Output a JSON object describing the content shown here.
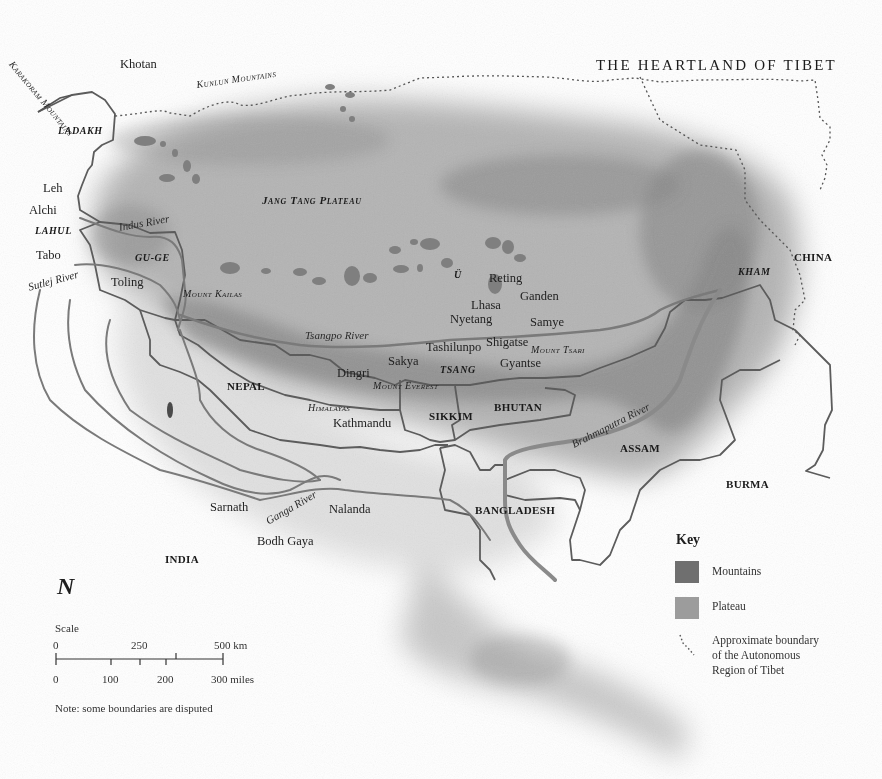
{
  "title": "THE HEARTLAND OF TIBET",
  "colors": {
    "mountains": "#6f6f6f",
    "plateau": "#9c9c9c",
    "border": "#5a5a5a",
    "river": "#7a7a7a",
    "tar_boundary": "#555555",
    "background": "#ffffff"
  },
  "labels": {
    "places": {
      "khotan": "Khotan",
      "leh": "Leh",
      "alchi": "Alchi",
      "tabo": "Tabo",
      "toling": "Toling",
      "reting": "Reting",
      "ganden": "Ganden",
      "lhasa": "Lhasa",
      "nyetang": "Nyetang",
      "samye": "Samye",
      "tashilunpo": "Tashilunpo",
      "shigatse": "Shigatse",
      "sakya": "Sakya",
      "gyantse": "Gyantse",
      "dingri": "Dingri",
      "kathmandu": "Kathmandu",
      "sarnath": "Sarnath",
      "nalanda": "Nalanda",
      "bodh_gaya": "Bodh Gaya"
    },
    "countries": {
      "china": "CHINA",
      "nepal": "NEPAL",
      "sikkim": "SIKKIM",
      "bhutan": "BHUTAN",
      "assam": "ASSAM",
      "burma": "BURMA",
      "bangladesh": "BANGLADESH",
      "india": "INDIA"
    },
    "regions": {
      "ladakh": "LADAKH",
      "lahul": "LAHUL",
      "gu_ge": "GU-GE",
      "u": "Ü",
      "tsang": "TSANG",
      "kham": "KHAM",
      "jang_tang_plateau": "Jang Tang Plateau"
    },
    "features": {
      "karakoram_mountains": "Karakoram Mountains",
      "kunlun_mountains": "Kunlun Mountains",
      "mount_kailas": "Mount Kailas",
      "mount_everest": "Mount Everest",
      "mount_tsari": "Mount Tsari",
      "himalayas": "Himalayas"
    },
    "rivers": {
      "indus": "Indus River",
      "sutlej": "Sutlej River",
      "tsangpo": "Tsangpo River",
      "brahmaputra": "Brahmaputra River",
      "ganga": "Ganga River"
    }
  },
  "north_arrow": "N",
  "scale": {
    "label": "Scale",
    "km_ticks": [
      "0",
      "250",
      "500 km"
    ],
    "mile_ticks": [
      "0",
      "100",
      "200",
      "300 miles"
    ]
  },
  "key": {
    "title": "Key",
    "items": [
      {
        "label": "Mountains",
        "swatch": "mountains"
      },
      {
        "label": "Plateau",
        "swatch": "plateau"
      },
      {
        "label": "Approximate boundary of the Autonomous Region of Tibet",
        "lines": [
          "Approximate boundary",
          "of the Autonomous",
          "Region of Tibet"
        ],
        "swatch": "dotted-line"
      }
    ]
  },
  "note": "Note: some boundaries are disputed"
}
